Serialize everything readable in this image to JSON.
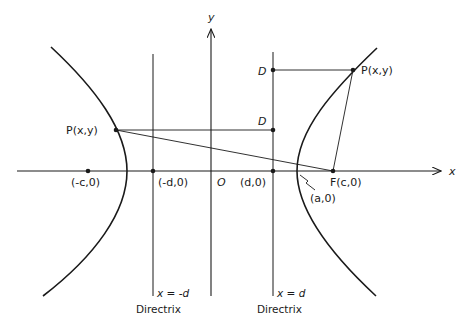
{
  "figure": {
    "axes": {
      "x_label": "x",
      "y_label": "y",
      "origin_label": "O"
    },
    "points": {
      "left_focus": "(-c,0)",
      "left_directrix_intercept": "(-d,0)",
      "right_directrix_intercept": "(d,0)",
      "right_focus": "F(c,0)",
      "vertex": "(a,0)",
      "left_point": "P(x,y)",
      "right_point": "P(x,y)",
      "left_foot_D": "D",
      "top_foot_D": "D"
    },
    "directrices": {
      "left_equation": "x = -d",
      "left_caption": "Directrix",
      "right_equation": "x = d",
      "right_caption": "Directrix"
    },
    "colors": {
      "ink": "#1a1a1a",
      "background": "#ffffff"
    }
  }
}
